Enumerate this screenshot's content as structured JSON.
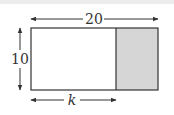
{
  "diagram": {
    "width_label": "20",
    "height_label": "10",
    "partial_width_label": "k",
    "colors": {
      "stroke": "#333333",
      "shaded_fill": "#d6d6d6",
      "background": "#ffffff",
      "top_band": "#ececec"
    }
  }
}
